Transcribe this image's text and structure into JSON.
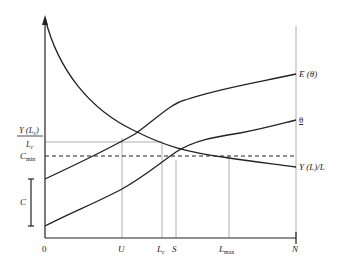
{
  "diagram": {
    "curves": {
      "E_theta": "E (θ)",
      "theta": "θ",
      "avg_output": "Y (L)/L"
    },
    "y_axis": {
      "frac_num": "Y (L",
      "frac_num_sub": "c",
      "frac_num_close": ")",
      "frac_den": "L",
      "frac_den_sub": "c",
      "c_min": "C",
      "c_min_sub": "min",
      "c_bracket": "C"
    },
    "x_axis": {
      "origin": "0",
      "U": "U",
      "Lc": "L",
      "Lc_sub": "c",
      "S": "S",
      "Lmax": "L",
      "Lmax_sub": "max",
      "N": "N"
    }
  }
}
